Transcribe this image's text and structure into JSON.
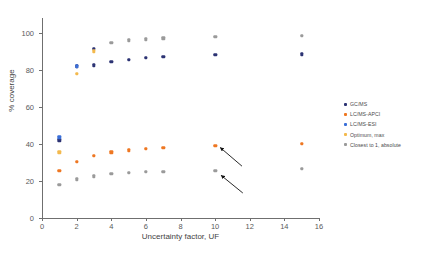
{
  "chart_data": {
    "type": "scatter",
    "title": "",
    "xlabel": "Uncertainty factor, UF",
    "ylabel": "% coverage",
    "xlim": [
      0,
      16
    ],
    "ylim": [
      0,
      108
    ],
    "xticks": [
      0,
      2,
      4,
      6,
      8,
      10,
      12,
      14,
      16
    ],
    "yticks": [
      0,
      20,
      40,
      60,
      80,
      100
    ],
    "grid": false,
    "legend_position": "right",
    "series": [
      {
        "name": "GC/MS",
        "color": "#2c3373",
        "x": [
          1,
          2,
          3,
          3,
          4,
          5,
          6,
          7,
          10,
          15
        ],
        "y": [
          42.0,
          82.0,
          82.5,
          91.5,
          84.5,
          85.5,
          86.5,
          87.0,
          88.0,
          88.5
        ]
      },
      {
        "name": "LC/MS-APCI",
        "color": "#ee7722",
        "x": [
          1,
          2,
          3,
          4,
          5,
          6,
          7,
          10,
          15
        ],
        "y": [
          25.5,
          30.5,
          33.5,
          35.5,
          36.5,
          37.5,
          38.0,
          39.0,
          40.0
        ]
      },
      {
        "name": "LC/MS-ESI",
        "color": "#3a6fd8",
        "x": [
          1,
          2
        ],
        "y": [
          43.5,
          82.0
        ]
      },
      {
        "name": "Optimum, max",
        "color": "#f3b94d",
        "x": [
          1,
          2,
          3
        ],
        "y": [
          35.5,
          78.0,
          90.0
        ]
      },
      {
        "name": "Closest to 1, absolute",
        "color": "#9a9a9a",
        "x": [
          1,
          2,
          3,
          4,
          5,
          6,
          7,
          10,
          15,
          4,
          5,
          6,
          7,
          10,
          15
        ],
        "y": [
          18.0,
          21.0,
          22.5,
          24.0,
          24.5,
          25.0,
          25.0,
          25.5,
          26.5,
          94.5,
          96.0,
          96.5,
          97.0,
          98.0,
          98.5
        ]
      }
    ],
    "annotations": [
      {
        "name": "arrow-to-lcms-apci-uf10",
        "from_x": 11.55,
        "from_y": 28.0,
        "to_x": 10.3,
        "to_y": 38.0
      },
      {
        "name": "arrow-to-closest-uf10",
        "from_x": 11.6,
        "from_y": 13.5,
        "to_x": 10.35,
        "to_y": 23.0
      }
    ]
  },
  "legend": {
    "items": [
      {
        "label": "GC/MS",
        "color": "#2c3373"
      },
      {
        "label": "LC/MS-APCI",
        "color": "#ee7722"
      },
      {
        "label": "LC/MS-ESI",
        "color": "#3a6fd8"
      },
      {
        "label": "Optimum, max",
        "color": "#f3b94d"
      },
      {
        "label": "Closest to 1, absolute",
        "color": "#9a9a9a"
      }
    ]
  },
  "axes": {
    "x_title": "Uncertainty factor, UF",
    "y_title": "% coverage",
    "x_tick_labels": [
      "0",
      "2",
      "4",
      "6",
      "8",
      "10",
      "12",
      "14",
      "16"
    ],
    "y_tick_labels": [
      "0",
      "20",
      "40",
      "60",
      "80",
      "100"
    ]
  }
}
